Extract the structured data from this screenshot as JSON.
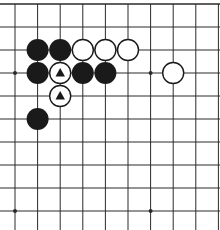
{
  "diagram": {
    "type": "go-board-fragment",
    "view": "top-left corner region",
    "colors": {
      "background": "#ffffff",
      "line": "#2a2a2a",
      "black_stone": "#1a1a1a",
      "white_stone_fill": "#ffffff",
      "white_stone_stroke": "#1a1a1a",
      "marker": "#1a1a1a"
    },
    "grid": {
      "origin_x": 15,
      "origin_y": 4,
      "spacing_x": 22.6,
      "spacing_y": 23,
      "columns": 10,
      "rows": 10,
      "top_edge": true,
      "left_edge": true
    },
    "star_points": [
      {
        "col": 0,
        "row": 3
      },
      {
        "col": 6,
        "row": 3
      },
      {
        "col": 0,
        "row": 9
      },
      {
        "col": 6,
        "row": 9
      }
    ],
    "stones": [
      {
        "color": "black",
        "col": 1,
        "row": 2
      },
      {
        "color": "black",
        "col": 2,
        "row": 2
      },
      {
        "color": "white",
        "col": 3,
        "row": 2
      },
      {
        "color": "white",
        "col": 4,
        "row": 2
      },
      {
        "color": "white",
        "col": 5,
        "row": 2
      },
      {
        "color": "black",
        "col": 1,
        "row": 3
      },
      {
        "color": "white",
        "col": 2,
        "row": 3,
        "marker": "triangle"
      },
      {
        "color": "black",
        "col": 3,
        "row": 3
      },
      {
        "color": "black",
        "col": 4,
        "row": 3
      },
      {
        "color": "white",
        "col": 7,
        "row": 3
      },
      {
        "color": "white",
        "col": 2,
        "row": 4,
        "marker": "triangle"
      },
      {
        "color": "black",
        "col": 1,
        "row": 5
      }
    ],
    "stone_radius": 10.5
  }
}
